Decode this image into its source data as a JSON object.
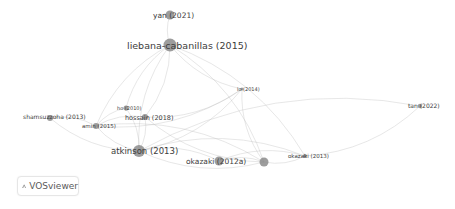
{
  "app": {
    "name": "VOSviewer",
    "logo_icon": "vosviewer-logo-icon"
  },
  "network": {
    "nodes": [
      {
        "id": "yan2021",
        "label": "yan (2021)",
        "weight": 3
      },
      {
        "id": "liebana2015",
        "label": "liebana-cabanillas (2015)",
        "weight": 5
      },
      {
        "id": "li2014",
        "label": "lo (2014)",
        "weight": 1
      },
      {
        "id": "tan2022",
        "label": "tan (2022)",
        "weight": 1
      },
      {
        "id": "shamsuzzoha2013",
        "label": "shamsuzzoha (2013)",
        "weight": 2
      },
      {
        "id": "ho2010",
        "label": "ho (2010)",
        "weight": 1
      },
      {
        "id": "hossain2018",
        "label": "hossain (2018)",
        "weight": 2
      },
      {
        "id": "amin2015",
        "label": "amin (2015)",
        "weight": 2
      },
      {
        "id": "atkinson2013",
        "label": "atkinson (2013)",
        "weight": 5
      },
      {
        "id": "okazaki2012a",
        "label": "okazaki (2012a)",
        "weight": 3
      },
      {
        "id": "okazaki2012b",
        "label": "",
        "weight": 3
      },
      {
        "id": "okazaki2013",
        "label": "okazaki (2013)",
        "weight": 1
      }
    ],
    "edges": [
      [
        "liebana2015",
        "yan2021"
      ],
      [
        "liebana2015",
        "amin2015"
      ],
      [
        "liebana2015",
        "hossain2018"
      ],
      [
        "liebana2015",
        "atkinson2013"
      ],
      [
        "liebana2015",
        "okazaki2012b"
      ],
      [
        "liebana2015",
        "li2014"
      ],
      [
        "liebana2015",
        "okazaki2013"
      ],
      [
        "liebana2015",
        "ho2010"
      ],
      [
        "shamsuzzoha2013",
        "amin2015"
      ],
      [
        "shamsuzzoha2013",
        "atkinson2013"
      ],
      [
        "amin2015",
        "hossain2018"
      ],
      [
        "amin2015",
        "atkinson2013"
      ],
      [
        "amin2015",
        "okazaki2012b"
      ],
      [
        "amin2015",
        "li2014"
      ],
      [
        "ho2010",
        "atkinson2013"
      ],
      [
        "ho2010",
        "amin2015"
      ],
      [
        "hossain2018",
        "atkinson2013"
      ],
      [
        "hossain2018",
        "okazaki2012b"
      ],
      [
        "atkinson2013",
        "okazaki2012a"
      ],
      [
        "atkinson2013",
        "okazaki2012b"
      ],
      [
        "atkinson2013",
        "okazaki2013"
      ],
      [
        "atkinson2013",
        "li2014"
      ],
      [
        "okazaki2012a",
        "okazaki2012b"
      ],
      [
        "okazaki2012b",
        "okazaki2013"
      ],
      [
        "okazaki2012a",
        "okazaki2013"
      ],
      [
        "li2014",
        "okazaki2012b"
      ],
      [
        "tan2022",
        "okazaki2013"
      ],
      [
        "tan2022",
        "atkinson2013"
      ],
      [
        "li2014",
        "hossain2018"
      ]
    ]
  }
}
